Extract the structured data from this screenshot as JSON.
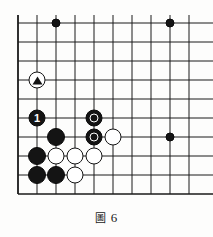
{
  "figure": {
    "caption_label": "圖",
    "caption_number": "6",
    "caption_full": "圖 6"
  },
  "board": {
    "type": "go-board",
    "game": "go",
    "view": "corner-excerpt",
    "columns_visible": 10,
    "rows_visible": 10,
    "origin_x": 18,
    "origin_y": 23,
    "spacing": 19,
    "edge_left": true,
    "edge_top": false,
    "edge_right": false,
    "edge_bottom": true,
    "line_color": "#1a1a1a",
    "board_color": "#fdfdfc",
    "black_color": "#141414",
    "white_color": "#ffffff"
  },
  "stones": [
    {
      "id": "s1",
      "color": "black",
      "col": 2,
      "row": 0,
      "size": 9,
      "style": "dot",
      "mark": "none",
      "label": ""
    },
    {
      "id": "s2",
      "color": "black",
      "col": 8,
      "row": 0,
      "size": 9,
      "style": "dot",
      "mark": "none",
      "label": ""
    },
    {
      "id": "s3",
      "color": "white",
      "col": 1,
      "row": 3,
      "size": 17,
      "style": "stone",
      "mark": "triangle",
      "label": ""
    },
    {
      "id": "s4",
      "color": "black",
      "col": 1,
      "row": 5,
      "size": 17,
      "style": "stone",
      "mark": "none",
      "label": "1"
    },
    {
      "id": "s5",
      "color": "black",
      "col": 4,
      "row": 5,
      "size": 17,
      "style": "stone",
      "mark": "circle",
      "label": ""
    },
    {
      "id": "s6",
      "color": "black",
      "col": 2,
      "row": 6,
      "size": 18,
      "style": "stone",
      "mark": "none",
      "label": ""
    },
    {
      "id": "s7",
      "color": "black",
      "col": 4,
      "row": 6,
      "size": 17,
      "style": "stone",
      "mark": "circle",
      "label": ""
    },
    {
      "id": "s8",
      "color": "white",
      "col": 5,
      "row": 6,
      "size": 17,
      "style": "stone",
      "mark": "none",
      "label": ""
    },
    {
      "id": "s9",
      "color": "black",
      "col": 8,
      "row": 6,
      "size": 9,
      "style": "dot",
      "mark": "none",
      "label": ""
    },
    {
      "id": "s10",
      "color": "black",
      "col": 1,
      "row": 7,
      "size": 18,
      "style": "stone",
      "mark": "none",
      "label": ""
    },
    {
      "id": "s11",
      "color": "white",
      "col": 2,
      "row": 7,
      "size": 17,
      "style": "stone",
      "mark": "none",
      "label": ""
    },
    {
      "id": "s12",
      "color": "white",
      "col": 3,
      "row": 7,
      "size": 17,
      "style": "stone",
      "mark": "none",
      "label": ""
    },
    {
      "id": "s13",
      "color": "white",
      "col": 4,
      "row": 7,
      "size": 17,
      "style": "stone",
      "mark": "none",
      "label": ""
    },
    {
      "id": "s14",
      "color": "black",
      "col": 1,
      "row": 8,
      "size": 18,
      "style": "stone",
      "mark": "none",
      "label": ""
    },
    {
      "id": "s15",
      "color": "black",
      "col": 2,
      "row": 8,
      "size": 18,
      "style": "stone",
      "mark": "none",
      "label": ""
    },
    {
      "id": "s16",
      "color": "white",
      "col": 3,
      "row": 8,
      "size": 17,
      "style": "stone",
      "mark": "none",
      "label": ""
    }
  ]
}
